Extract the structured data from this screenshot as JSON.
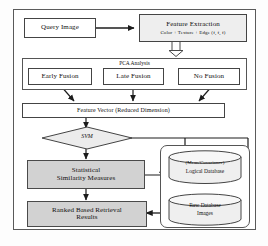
{
  "diagram": {
    "type": "flowchart",
    "nodes": {
      "query_image": "Query Image",
      "feature_extraction_line1": "Feature Extraction",
      "feature_extraction_line2": "Color + Texture + Edge (f, f, f)",
      "pca_caption": "PCA   Analysis",
      "early_fusion": "Early Fusion",
      "late_fusion": "Late Fusion",
      "no_fusion": "No Fusion",
      "feature_vector": "Feature Vector (Reduced Dimension)",
      "svm": "SVM",
      "similarity_line1": "Statistical",
      "similarity_line2": "Similarity Measures",
      "retrieval_line1": "Ranked Based Retrieval",
      "retrieval_line2": "Results",
      "logical_db_line1": "(Mean/Covariance)",
      "logical_db_line2": "Logical Database",
      "raw_db_line1": "Raw Database",
      "raw_db_line2": "Images"
    },
    "colors": {
      "shaded_fill": "#d2d2d2",
      "node_stroke": "#444444",
      "frame_stroke": "#5a5a5a",
      "canvas": "#ffffff"
    }
  }
}
